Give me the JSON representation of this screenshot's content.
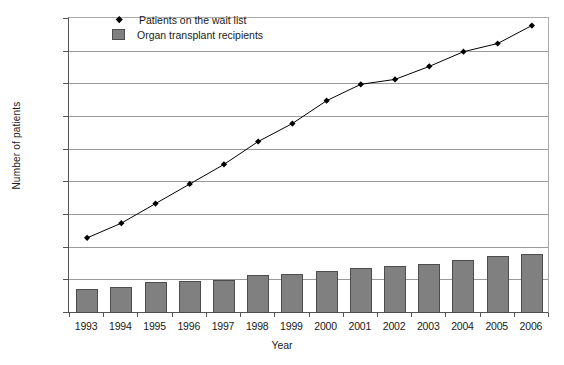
{
  "chart_data": {
    "type": "bar",
    "title": "",
    "xlabel": "Year",
    "ylabel": "Number of patients",
    "categories": [
      "1993",
      "1994",
      "1995",
      "1996",
      "1997",
      "1998",
      "1999",
      "2000",
      "2001",
      "2002",
      "2003",
      "2004",
      "2005",
      "2006"
    ],
    "ylim": [
      10000,
      100000
    ],
    "ytick_values": [
      10000,
      20000,
      30000,
      40000,
      50000,
      60000,
      70000,
      80000,
      90000,
      100000
    ],
    "ytick_labels": [
      "10000",
      "20000",
      "30000",
      "40000",
      "50000",
      "60000",
      "70000",
      "80000",
      "90000",
      "100000"
    ],
    "grid": true,
    "legend_position": "top-left-inside",
    "series": [
      {
        "name": "Patients on the wait list",
        "type": "line",
        "marker": "diamond",
        "color": "#000000",
        "values": [
          33000,
          37500,
          43500,
          49500,
          55500,
          62500,
          68000,
          75000,
          80000,
          81500,
          85500,
          90000,
          92500,
          98000
        ]
      },
      {
        "name": "Organ transplant recipients",
        "type": "bar",
        "color": "#808080",
        "values": [
          17500,
          18000,
          19500,
          19700,
          20000,
          21500,
          21800,
          23000,
          23800,
          24500,
          25000,
          26200,
          27400,
          28000
        ]
      }
    ]
  },
  "legend": {
    "items": [
      {
        "label": "Patients on the wait list",
        "marker": "diamond"
      },
      {
        "label": "Organ transplant recipients",
        "marker": "swatch"
      }
    ]
  }
}
